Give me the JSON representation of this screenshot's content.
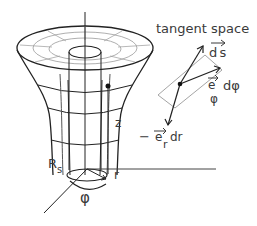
{
  "diagram": {
    "title": "tangent space",
    "labels": {
      "ds": "d s",
      "e_phi": "e",
      "e_phi_sub": "φ",
      "dphi": "dφ",
      "minus": "−",
      "e_r": "e",
      "e_r_sub": "r",
      "dr": "dr",
      "z": "z",
      "r": "r",
      "Rs": "R",
      "Rs_sub": "s",
      "phi": "φ"
    },
    "colors": {
      "line": "#222222",
      "grid": "#9a9a9a",
      "text": "#3a3a3a",
      "plane": "#9a9a9a"
    }
  }
}
